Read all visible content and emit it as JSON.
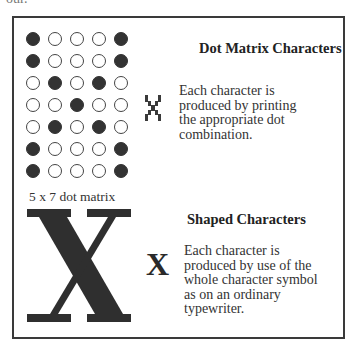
{
  "page": {
    "top_fragment": "our."
  },
  "dot_matrix": {
    "rows": 7,
    "cols": 5,
    "pattern": [
      [
        1,
        0,
        0,
        0,
        1
      ],
      [
        1,
        0,
        0,
        0,
        1
      ],
      [
        0,
        1,
        0,
        1,
        0
      ],
      [
        0,
        0,
        1,
        0,
        0
      ],
      [
        0,
        1,
        0,
        1,
        0
      ],
      [
        1,
        0,
        0,
        0,
        1
      ],
      [
        1,
        0,
        0,
        0,
        1
      ]
    ],
    "caption": "5  x  7 dot matrix",
    "heading": "Dot Matrix Characters",
    "description_lines": [
      "Each character is",
      "produced by printing",
      "the appropriate dot",
      "combination."
    ],
    "sample_icon": "dot-matrix-x-glyph"
  },
  "shaped": {
    "big_letter": "X",
    "small_letter": "X",
    "heading": "Shaped Characters",
    "description_lines": [
      "Each character is",
      "produced by use of the",
      "whole character symbol",
      "as on an ordinary",
      "typewriter."
    ]
  },
  "colors": {
    "ink": "#333333",
    "border": "#3a3a3a",
    "background": "#ffffff"
  }
}
